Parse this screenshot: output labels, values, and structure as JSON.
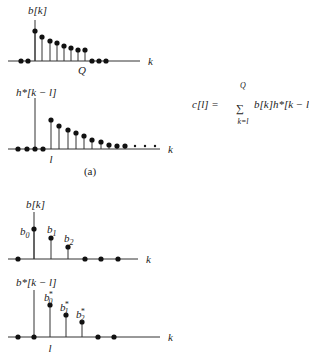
{
  "figure": {
    "caption_a": "(a)",
    "plots": [
      {
        "id": "b-of-k-long",
        "ylabel": "b[k]",
        "xlabel": "k",
        "tick_label": "Q",
        "axis_y": 61,
        "origin_x": 35,
        "stems": [
          [
            35,
            31
          ],
          [
            42,
            37
          ],
          [
            50,
            41
          ],
          [
            57,
            43
          ],
          [
            64,
            46
          ],
          [
            71,
            48
          ],
          [
            78,
            50
          ],
          [
            85,
            50
          ]
        ],
        "zeros": [
          21,
          28,
          92,
          99,
          106
        ],
        "x_end": 140
      },
      {
        "id": "h-conj-shift",
        "ylabel": "h*[k − l]",
        "xlabel": "k",
        "tick_label": "l",
        "axis_y": 149,
        "origin_x": 35,
        "stems": [
          [
            51,
            120
          ],
          [
            59,
            126
          ],
          [
            68,
            130
          ],
          [
            76,
            133
          ],
          [
            84,
            136
          ],
          [
            92,
            140
          ],
          [
            101,
            142
          ],
          [
            109,
            145
          ],
          [
            117,
            146
          ],
          [
            125,
            146
          ]
        ],
        "zeros": [
          18,
          27,
          35,
          43
        ],
        "ellipsis_dots": [
          135,
          145,
          155
        ],
        "x_end": 160
      },
      {
        "id": "b-of-k-short",
        "ylabel": "b[k]",
        "xlabel": "k",
        "axis_y": 259,
        "origin_x": 34,
        "stems": [
          [
            34,
            229
          ],
          [
            51,
            238
          ],
          [
            68,
            247
          ]
        ],
        "stem_labels": [
          "b0",
          "b1",
          "b2"
        ],
        "zeros": [
          18,
          85,
          101,
          118
        ],
        "x_end": 138
      },
      {
        "id": "b-conj-shift",
        "ylabel": "b*[k − l]",
        "xlabel": "k",
        "tick_label": "l",
        "axis_y": 337,
        "origin_x": 34,
        "stems": [
          [
            50,
            305
          ],
          [
            66,
            315
          ],
          [
            82,
            322
          ]
        ],
        "stem_labels": [
          "b0*",
          "b1*",
          "b2*"
        ],
        "zeros": [
          18,
          34,
          98,
          114
        ],
        "x_end": 160
      }
    ],
    "equation": {
      "lhs": "c[l] =",
      "sum_upper": "Q",
      "sum_lower": "k=l",
      "sum_symbol": "∑",
      "rhs": "b[k]h*[k − l]"
    }
  }
}
